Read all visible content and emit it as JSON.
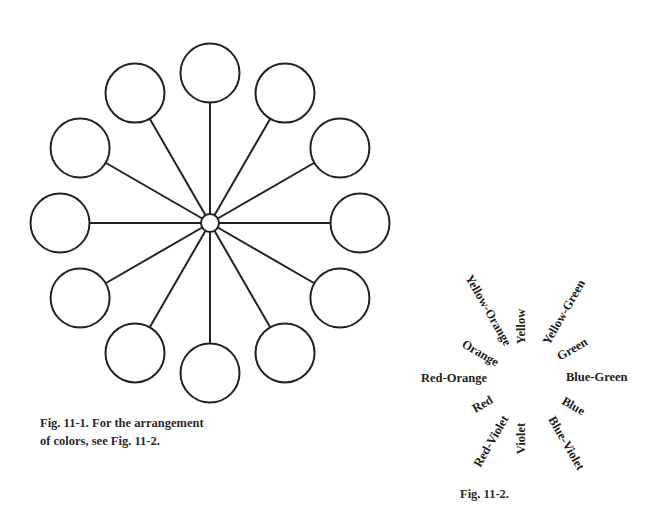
{
  "figure_1": {
    "caption_line1": "Fig. 11-1. For the arrangement",
    "caption_line2": "of colors, see Fig. 11-2.",
    "center": {
      "x": 210,
      "y": 223,
      "r": 9
    },
    "spoke_radius": 150,
    "circle_radius": 29.5,
    "circle_count": 12,
    "stroke_color": "#222222"
  },
  "figure_2": {
    "caption": "Fig. 11-2.",
    "labels": [
      {
        "text": "Yellow",
        "x": 521,
        "y": 326,
        "angle": -90
      },
      {
        "text": "Yellow-Green",
        "x": 564,
        "y": 312,
        "angle": -60
      },
      {
        "text": "Green",
        "x": 572,
        "y": 349,
        "angle": -30
      },
      {
        "text": "Blue-Green",
        "x": 597,
        "y": 377,
        "angle": 0
      },
      {
        "text": "Blue",
        "x": 573,
        "y": 406,
        "angle": 30
      },
      {
        "text": "Blue-Violet",
        "x": 566,
        "y": 443,
        "angle": 60
      },
      {
        "text": "Violet",
        "x": 521,
        "y": 438,
        "angle": -90
      },
      {
        "text": "Red-Violet",
        "x": 491,
        "y": 441,
        "angle": -60
      },
      {
        "text": "Red",
        "x": 483,
        "y": 404,
        "angle": -30
      },
      {
        "text": "Red-Orange",
        "x": 454,
        "y": 378,
        "angle": 0
      },
      {
        "text": "Orange",
        "x": 480,
        "y": 353,
        "angle": 30
      },
      {
        "text": "Yellow-Orange",
        "x": 488,
        "y": 310,
        "angle": 60
      }
    ]
  }
}
